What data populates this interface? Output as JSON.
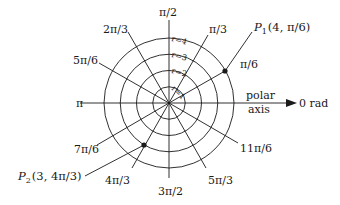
{
  "diagram": {
    "type": "polar-coordinate-grid",
    "center": {
      "x": 169,
      "y": 103
    },
    "unit_px": 16.25,
    "circles": [
      {
        "r": 1,
        "label": "r=1"
      },
      {
        "r": 2,
        "label": "r=2"
      },
      {
        "r": 3,
        "label": "r=3"
      },
      {
        "r": 4,
        "label": "r=4"
      }
    ],
    "angle_labels": [
      {
        "id": "pi-over-2",
        "deg": 90,
        "text": "π/2"
      },
      {
        "id": "pi-over-3",
        "deg": 60,
        "text": "π/3"
      },
      {
        "id": "2pi-over-3",
        "deg": 120,
        "text": "2π/3"
      },
      {
        "id": "5pi-over-6",
        "deg": 150,
        "text": "5π/6"
      },
      {
        "id": "pi-over-6",
        "deg": 30,
        "text": "π/6"
      },
      {
        "id": "pi",
        "deg": 180,
        "text": "π"
      },
      {
        "id": "7pi-over-6",
        "deg": 210,
        "text": "7π/6"
      },
      {
        "id": "4pi-over-3",
        "deg": 240,
        "text": "4π/3"
      },
      {
        "id": "3pi-over-2",
        "deg": 270,
        "text": "3π/2"
      },
      {
        "id": "5pi-over-3",
        "deg": 300,
        "text": "5π/3"
      },
      {
        "id": "11pi-over-6",
        "deg": 330,
        "text": "11π/6"
      }
    ],
    "polar_axis": {
      "line1": "polar",
      "line2": "axis",
      "end_label": "0 rad"
    },
    "points": [
      {
        "id": "P1",
        "name": "P",
        "sub": "1",
        "coords": "(4, π/6)",
        "r": 4,
        "theta_deg": 30
      },
      {
        "id": "P2",
        "name": "P",
        "sub": "2",
        "coords": "(3, 4π/3)",
        "r": 3,
        "theta_deg": 240
      }
    ],
    "colors": {
      "ink": "#1a1a1a",
      "background": "#ffffff"
    }
  }
}
